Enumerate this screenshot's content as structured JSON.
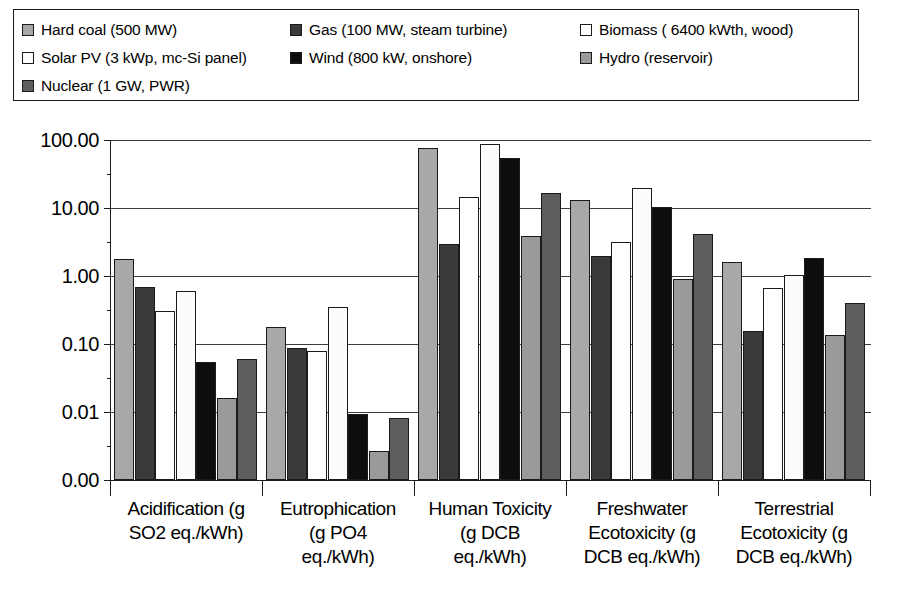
{
  "legend": {
    "rows": [
      [
        {
          "label": "Hard coal (500 MW)",
          "swatch": "#a8a8a8",
          "icon": "legend-swatch"
        },
        {
          "label": "Gas (100 MW, steam turbine)",
          "swatch": "#3a3a3a",
          "icon": "legend-swatch"
        },
        {
          "label": "Biomass ( 6400 kWth, wood)",
          "swatch": "#ffffff",
          "icon": "legend-swatch"
        }
      ],
      [
        {
          "label": "Solar PV (3 kWp, mc-Si panel)",
          "swatch": "#fbfbfb",
          "icon": "legend-swatch"
        },
        {
          "label": "Wind (800 kW, onshore)",
          "swatch": "#0d0d0d",
          "icon": "legend-swatch"
        },
        {
          "label": "Hydro (reservoir)",
          "swatch": "#9a9a9a",
          "icon": "legend-swatch"
        }
      ],
      [
        {
          "label": "Nuclear (1 GW, PWR)",
          "swatch": "#5e5e5e",
          "icon": "legend-swatch"
        }
      ]
    ]
  },
  "axis": {
    "y_ticks": [
      "100.00",
      "10.00",
      "1.00",
      "0.10",
      "0.01",
      "0.00"
    ],
    "y_tick_values": [
      100,
      10,
      1,
      0.1,
      0.01,
      0.001
    ]
  },
  "chart_data": {
    "type": "bar",
    "title": "",
    "xlabel": "",
    "ylabel": "",
    "scale": "log",
    "ylim": [
      0.001,
      100
    ],
    "grid": true,
    "legend_position": "top",
    "categories": [
      "Acidification (g SO2 eq./kWh)",
      "Eutrophication (g PO4 eq./kWh)",
      "Human Toxicity (g DCB eq./kWh)",
      "Freshwater Ecotoxicity (g DCB eq./kWh)",
      "Terrestrial Ecotoxicity (g DCB eq./kWh)"
    ],
    "category_labels_wrapped": [
      [
        "Acidification (g",
        "SO2 eq./kWh)"
      ],
      [
        "Eutrophication",
        "(g PO4",
        "eq./kWh)"
      ],
      [
        "Human Toxicity",
        "(g DCB",
        "eq./kWh)"
      ],
      [
        "Freshwater",
        "Ecotoxicity (g",
        "DCB eq./kWh)"
      ],
      [
        "Terrestrial",
        "Ecotoxicity (g",
        "DCB eq./kWh)"
      ]
    ],
    "series": [
      {
        "name": "Hard coal (500 MW)",
        "color": "#a8a8a8",
        "values": [
          1.75,
          0.18,
          75.0,
          13.0,
          1.6
        ]
      },
      {
        "name": "Gas (100 MW, steam turbine)",
        "color": "#3a3a3a",
        "values": [
          0.7,
          0.088,
          3.0,
          2.0,
          0.155
        ]
      },
      {
        "name": "Biomass ( 6400 kWth, wood)",
        "color": "#ffffff",
        "values": [
          0.31,
          0.078,
          14.5,
          3.2,
          0.67
        ]
      },
      {
        "name": "Solar PV (3 kWp, mc-Si panel)",
        "color": "#fbfbfb",
        "values": [
          0.6,
          0.35,
          88.0,
          20.0,
          1.05
        ]
      },
      {
        "name": "Wind (800 kW, onshore)",
        "color": "#0d0d0d",
        "values": [
          0.055,
          0.0095,
          55.0,
          10.5,
          1.85
        ]
      },
      {
        "name": "Hydro (reservoir)",
        "color": "#9a9a9a",
        "values": [
          0.016,
          0.0027,
          3.9,
          0.9,
          0.135
        ]
      },
      {
        "name": "Nuclear (1 GW, PWR)",
        "color": "#5e5e5e",
        "values": [
          0.06,
          0.0082,
          16.5,
          4.2,
          0.4
        ]
      }
    ]
  }
}
